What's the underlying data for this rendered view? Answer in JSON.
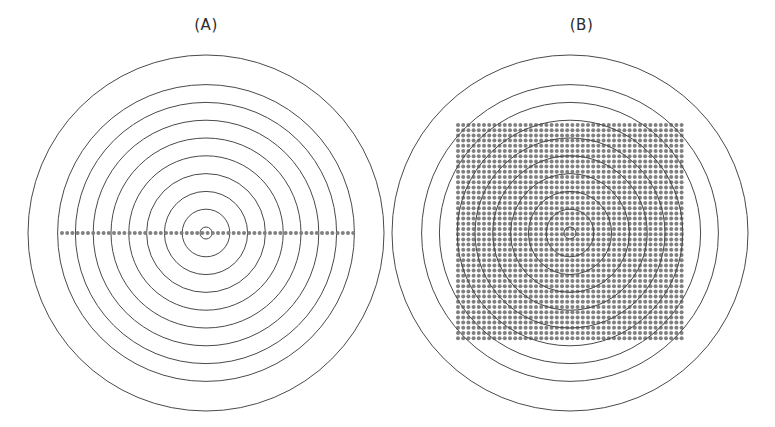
{
  "figure": {
    "width": 775,
    "height": 427,
    "background_color": "#ffffff",
    "circle_stroke_color": "#4a4a4a",
    "circle_stroke_width": 1.0,
    "dot_color": "#808080",
    "label_color": "#2b2b2b"
  },
  "panels": [
    {
      "id": "a",
      "label": "(A)",
      "sampling_type": "linear",
      "description": "Concentric circles with a single horizontal line of sample points through the center",
      "center": {
        "x": 206,
        "y": 233
      },
      "circle_count": 10,
      "ring_spacing": 17.8,
      "outer_radius": 178,
      "inner_radius": 6,
      "dot_line": {
        "y": 233,
        "x_start": 62,
        "x_end": 356,
        "dot_spacing": 5.2,
        "dot_radius": 2.0,
        "dot_count": 58
      }
    },
    {
      "id": "b",
      "label": "(B)",
      "sampling_type": "cartesian-grid",
      "description": "Concentric circles overlaid with a dense square Cartesian grid of sample points",
      "center": {
        "x": 182,
        "y": 233
      },
      "circle_count": 10,
      "ring_spacing": 17.8,
      "outer_radius": 178,
      "inner_radius": 6,
      "dot_grid": {
        "x_start": 70,
        "x_end": 294,
        "y_start": 125,
        "y_end": 343,
        "dot_spacing_x": 5.2,
        "dot_spacing_y": 5.2,
        "dot_radius": 2.0,
        "columns": 44,
        "rows": 43
      }
    }
  ],
  "chart_data": {
    "type": "scatter",
    "title": "",
    "xlabel": "",
    "ylabel": "",
    "grid": false,
    "legend": null,
    "annotations": [
      "(A)",
      "(B)"
    ],
    "series": [
      {
        "name": "concentric-rings-panel-A",
        "type": "rings",
        "radii": [
          6,
          24,
          42,
          60,
          77,
          95,
          113,
          131,
          149,
          178
        ]
      },
      {
        "name": "sample-points-panel-A",
        "type": "line-samples",
        "count": 58,
        "x_range": [
          -144,
          150
        ],
        "y": 0
      },
      {
        "name": "concentric-rings-panel-B",
        "type": "rings",
        "radii": [
          6,
          24,
          42,
          60,
          77,
          95,
          113,
          131,
          149,
          178
        ]
      },
      {
        "name": "sample-points-panel-B",
        "type": "grid-samples",
        "count": 1892,
        "x_range": [
          -112,
          112
        ],
        "y_range": [
          -108,
          110
        ]
      }
    ]
  }
}
